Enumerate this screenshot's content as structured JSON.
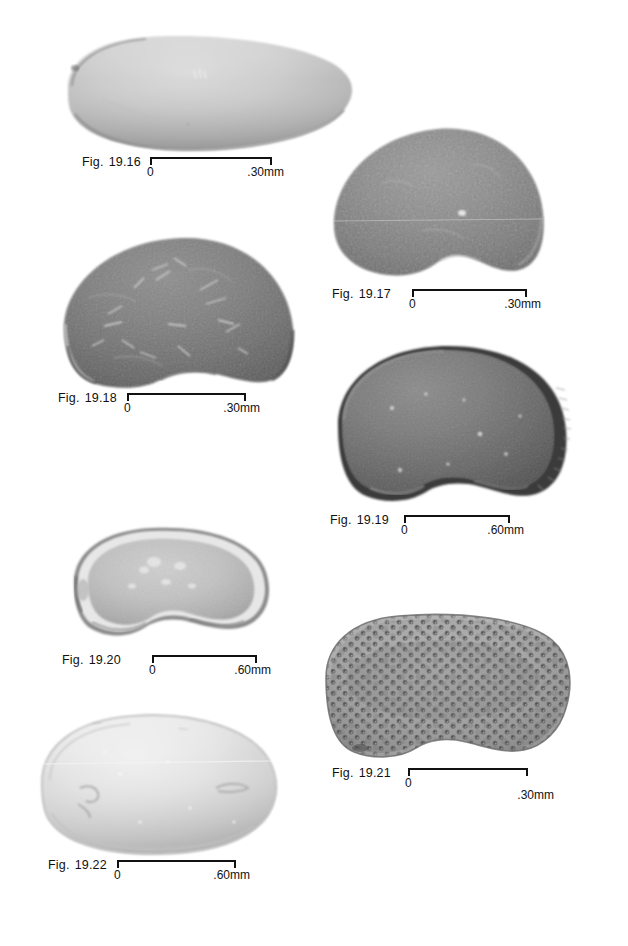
{
  "plate": {
    "background_color": "#ffffff",
    "width": 628,
    "height": 946,
    "ink_color": "#111111",
    "figure_count": 7
  },
  "figures": [
    {
      "id": "19.16",
      "prefix": "Fig.",
      "number": "19.16",
      "scale_zero": "0",
      "scale_max": ".30mm",
      "specimen": {
        "shape": "elongate-subrectangular-valve",
        "surface": "smooth",
        "tone": "light-grey",
        "orientation": "lateral-view"
      }
    },
    {
      "id": "19.17",
      "prefix": "Fig.",
      "number": "19.17",
      "scale_zero": "0",
      "scale_max": ".30mm",
      "specimen": {
        "shape": "rounded-triangular-valve",
        "surface": "finely-wrinkled",
        "tone": "medium-dark-grey",
        "orientation": "lateral-view"
      }
    },
    {
      "id": "19.18",
      "prefix": "Fig.",
      "number": "19.18",
      "scale_zero": "0",
      "scale_max": ".30mm",
      "specimen": {
        "shape": "rounded-triangular-valve",
        "surface": "scratched-with-fibres",
        "tone": "dark-grey",
        "orientation": "lateral-view"
      }
    },
    {
      "id": "19.19",
      "prefix": "Fig.",
      "number": "19.19",
      "scale_zero": "0",
      "scale_max": ".60mm",
      "specimen": {
        "shape": "ovate-valve-with-marginal-flange",
        "surface": "smooth-with-ribbed-rim",
        "tone": "dark-grey",
        "orientation": "lateral-view"
      }
    },
    {
      "id": "19.20",
      "prefix": "Fig.",
      "number": "19.20",
      "scale_zero": "0",
      "scale_max": ".60mm",
      "specimen": {
        "shape": "reniform-valve",
        "surface": "smooth-with-bright-rim",
        "tone": "light-grey",
        "orientation": "lateral-view"
      }
    },
    {
      "id": "19.21",
      "prefix": "Fig.",
      "number": "19.21",
      "scale_zero": "0",
      "scale_max": ".30mm",
      "specimen": {
        "shape": "subrectangular-reniform-valve",
        "surface": "coarsely-punctate-reticulate",
        "tone": "medium-grey",
        "orientation": "lateral-view"
      }
    },
    {
      "id": "19.22",
      "prefix": "Fig.",
      "number": "19.22",
      "scale_zero": "0",
      "scale_max": ".60mm",
      "specimen": {
        "shape": "ovate-elongate-valve",
        "surface": "smooth-glossy",
        "tone": "very-light-grey",
        "orientation": "lateral-view"
      }
    }
  ]
}
